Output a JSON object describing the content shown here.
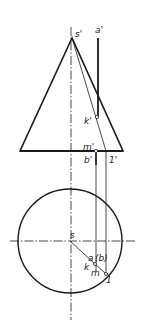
{
  "diagram": {
    "labels": {
      "s_prime": "s'",
      "a_prime": "a'",
      "k_prime": "k'",
      "m_prime": "m'",
      "b_prime": "b'",
      "one_prime": "1'",
      "s": "s",
      "a": "a",
      "b_paren": "(b)",
      "k": "k",
      "m": "m",
      "one": "1"
    },
    "colors": {
      "stroke": "#1a1a1a",
      "background": "#ffffff"
    }
  }
}
